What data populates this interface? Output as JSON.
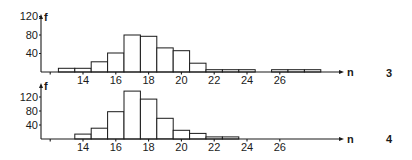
{
  "chart_data": [
    {
      "type": "bar",
      "panel_label": "3",
      "title": "",
      "xlabel": "n",
      "ylabel": "f",
      "x_ticks": [
        14,
        16,
        18,
        20,
        22,
        24,
        26
      ],
      "y_ticks": [
        40,
        80,
        120
      ],
      "ylim": [
        0,
        125
      ],
      "categories": [
        13,
        14,
        15,
        16,
        17,
        18,
        19,
        20,
        21,
        22,
        23,
        24,
        25,
        26,
        27,
        28
      ],
      "values": [
        8,
        8,
        22,
        41,
        80,
        77,
        52,
        46,
        19,
        5,
        5,
        5,
        0,
        5,
        5,
        5
      ],
      "grid": false,
      "legend": "none"
    },
    {
      "type": "bar",
      "panel_label": "4",
      "title": "",
      "xlabel": "n",
      "ylabel": "f",
      "x_ticks": [
        14,
        16,
        18,
        20,
        22,
        24,
        26
      ],
      "y_ticks": [
        40,
        80,
        120
      ],
      "ylim": [
        0,
        155
      ],
      "categories": [
        14,
        15,
        16,
        17,
        18,
        19,
        20,
        21,
        22,
        23
      ],
      "values": [
        14,
        31,
        78,
        137,
        114,
        59,
        25,
        16,
        6,
        6
      ],
      "grid": false,
      "legend": "none"
    }
  ],
  "layout": {
    "panels": [
      {
        "axis_y": 72,
        "top_y": 14,
        "px_per_unit": 0.463,
        "y_tick_labels": [
          "40",
          "80",
          "120"
        ],
        "y_tick_values": [
          40,
          80,
          120
        ],
        "x_label_y": 84,
        "panel_label_y": 77
      },
      {
        "axis_y": 139,
        "top_y": 83,
        "px_per_unit": 0.35,
        "y_tick_labels": [
          "40",
          "80",
          "120"
        ],
        "y_tick_values": [
          40,
          80,
          120
        ],
        "x_label_y": 151,
        "panel_label_y": 143
      }
    ],
    "y_axis_x": 41,
    "x_arrow_end": 344,
    "x14_px": 83,
    "px_per_n": 16.4,
    "minor_tick_n": 12
  }
}
